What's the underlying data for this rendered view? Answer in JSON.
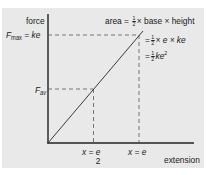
{
  "diagram": {
    "y_axis_label": "force",
    "x_axis_label": "extension",
    "fmax_label": {
      "symbol": "F",
      "subscript": "max",
      "equals": "= ke"
    },
    "fav_label": {
      "symbol": "F",
      "subscript": "av"
    },
    "x_half_label": {
      "lhs": "x =",
      "num": "e",
      "den": "2"
    },
    "x_full_label": "x = e",
    "area_eq": {
      "line1_prefix": "area =",
      "line1_frac_num": "1",
      "line1_frac_den": "2",
      "line1_suffix": "× base × height",
      "line2_prefix": "=",
      "line2_frac_num": "1",
      "line2_frac_den": "2",
      "line2_suffix": "× e × ke",
      "line3_prefix": "=",
      "line3_frac_num": "1",
      "line3_frac_den": "2",
      "line3_suffix": "ke",
      "line3_sup": "2"
    },
    "colors": {
      "panel": "#e9e9e9",
      "line": "#3a3a3a",
      "axis": "#222222",
      "dash": "#555555"
    },
    "line_points": {
      "x": [
        0,
        1
      ],
      "y": [
        0,
        1
      ]
    },
    "half_point": {
      "x": 0.5,
      "y": 0.5
    }
  }
}
